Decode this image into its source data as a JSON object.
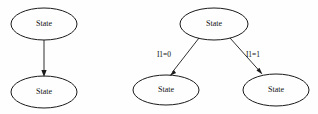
{
  "figure": {
    "background_color": "#fefefe",
    "stroke_color": "#1a1a1a",
    "text_color": "#101010",
    "width": 318,
    "height": 114
  },
  "diagrams": [
    {
      "id": "left-diagram",
      "name": "unconditional-transition",
      "nodes": [
        {
          "id": "left-top",
          "label": "State",
          "cx": 44,
          "cy": 24,
          "rx": 33,
          "ry": 16
        },
        {
          "id": "left-bottom",
          "label": "State",
          "cx": 44,
          "cy": 92,
          "rx": 33,
          "ry": 16
        }
      ],
      "edges": [
        {
          "id": "left-edge",
          "from": "left-top",
          "to": "left-bottom",
          "label": "",
          "x1": 44,
          "y1": 40,
          "x2": 44,
          "y2": 76
        }
      ]
    },
    {
      "id": "right-diagram",
      "name": "conditional-branch",
      "nodes": [
        {
          "id": "right-top",
          "label": "State",
          "cx": 214,
          "cy": 24,
          "rx": 34,
          "ry": 16
        },
        {
          "id": "right-bottom-left",
          "label": "State",
          "cx": 166,
          "cy": 90,
          "rx": 33,
          "ry": 15
        },
        {
          "id": "right-bottom-right",
          "label": "State",
          "cx": 276,
          "cy": 90,
          "rx": 33,
          "ry": 16
        }
      ],
      "edges": [
        {
          "id": "right-edge-zero",
          "from": "right-top",
          "to": "right-bottom-left",
          "label": "I1=0",
          "label_x": 164,
          "label_y": 55,
          "x1": 199,
          "y1": 38,
          "x2": 171,
          "y2": 74
        },
        {
          "id": "right-edge-one",
          "from": "right-top",
          "to": "right-bottom-right",
          "label": "I1=1",
          "label_x": 253,
          "label_y": 55,
          "x1": 230,
          "y1": 38,
          "x2": 261,
          "y2": 73
        }
      ]
    }
  ]
}
